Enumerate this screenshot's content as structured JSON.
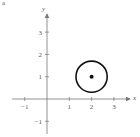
{
  "figure_label": "a",
  "chart_data": {
    "type": "scatter",
    "title": "",
    "xlabel": "x",
    "ylabel": "y",
    "xlim": [
      -1.5,
      3.8
    ],
    "ylim": [
      -1.6,
      3.6
    ],
    "x_ticks": [
      -1,
      1,
      2,
      3
    ],
    "y_ticks": [
      -1,
      1,
      2,
      3
    ],
    "x_tick_labels": [
      "−1",
      "1",
      "2",
      "3"
    ],
    "y_tick_labels": [
      "−1",
      "1",
      "2",
      "3"
    ],
    "grid": false,
    "legend": null,
    "shapes": [
      {
        "kind": "circle",
        "center": [
          2,
          1
        ],
        "radius": 0.7,
        "filled": false
      }
    ],
    "points": [
      {
        "x": 2,
        "y": 1,
        "filled": true
      }
    ]
  },
  "colors": {
    "axis": "#777777",
    "shape": "#111111",
    "text": "#555555"
  }
}
